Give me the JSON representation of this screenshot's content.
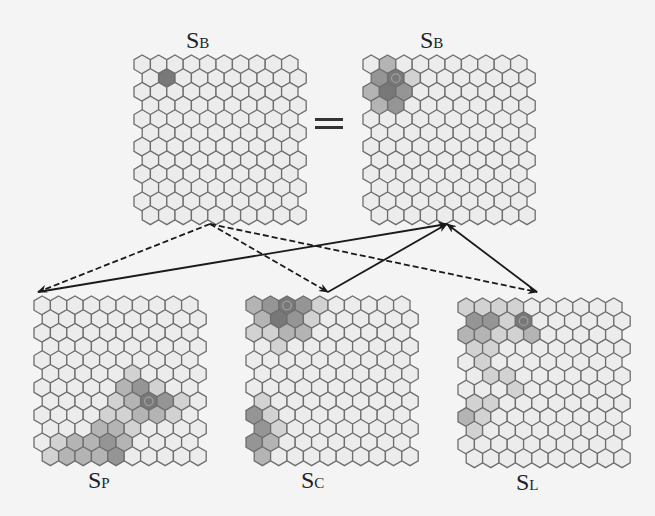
{
  "figure": {
    "equals_sign": "=",
    "grid": {
      "cols": 10,
      "rows": 12,
      "hex_w": 16.4,
      "row_h": 13.7,
      "stroke": "#6e6e6e",
      "base_fill": "#ececec"
    },
    "colors": {
      "level0": "#ececec",
      "level1": "#d2d2d2",
      "level2": "#b4b4b4",
      "level3": "#959595",
      "level4": "#787878",
      "winner_ring": "#a0a0a0",
      "arrow": "#1a1a1a"
    },
    "panels": [
      {
        "id": "SB_left",
        "label_main": "S",
        "label_sub": "B",
        "x": 133,
        "y": 54,
        "label_x": 198,
        "label_y": 28,
        "cells": [
          {
            "r": 1,
            "c": 1,
            "v": 4
          }
        ],
        "winner": null
      },
      {
        "id": "SB_right",
        "label_main": "S",
        "label_sub": "B",
        "x": 362,
        "y": 54,
        "label_x": 432,
        "label_y": 28,
        "cells": [
          {
            "r": 0,
            "c": 1,
            "v": 2
          },
          {
            "r": 1,
            "c": 0,
            "v": 3
          },
          {
            "r": 1,
            "c": 1,
            "v": 4
          },
          {
            "r": 1,
            "c": 2,
            "v": 1
          },
          {
            "r": 2,
            "c": 0,
            "v": 2
          },
          {
            "r": 2,
            "c": 1,
            "v": 4
          },
          {
            "r": 2,
            "c": 2,
            "v": 3
          },
          {
            "r": 3,
            "c": 0,
            "v": 2
          },
          {
            "r": 3,
            "c": 1,
            "v": 3
          }
        ],
        "winner": {
          "r": 1,
          "c": 1
        }
      },
      {
        "id": "SP",
        "label_main": "S",
        "label_sub": "P",
        "x": 33,
        "y": 295,
        "label_x": 100,
        "label_y": 468,
        "cells": [
          {
            "r": 5,
            "c": 5,
            "v": 1
          },
          {
            "r": 6,
            "c": 5,
            "v": 2
          },
          {
            "r": 6,
            "c": 6,
            "v": 3
          },
          {
            "r": 6,
            "c": 7,
            "v": 1
          },
          {
            "r": 7,
            "c": 4,
            "v": 1
          },
          {
            "r": 7,
            "c": 5,
            "v": 2
          },
          {
            "r": 7,
            "c": 6,
            "v": 4
          },
          {
            "r": 7,
            "c": 7,
            "v": 3
          },
          {
            "r": 7,
            "c": 8,
            "v": 1
          },
          {
            "r": 8,
            "c": 4,
            "v": 1
          },
          {
            "r": 8,
            "c": 5,
            "v": 1
          },
          {
            "r": 8,
            "c": 6,
            "v": 2
          },
          {
            "r": 8,
            "c": 7,
            "v": 2
          },
          {
            "r": 8,
            "c": 8,
            "v": 1
          },
          {
            "r": 9,
            "c": 3,
            "v": 2
          },
          {
            "r": 9,
            "c": 4,
            "v": 2
          },
          {
            "r": 9,
            "c": 5,
            "v": 1
          },
          {
            "r": 10,
            "c": 1,
            "v": 1
          },
          {
            "r": 10,
            "c": 2,
            "v": 2
          },
          {
            "r": 10,
            "c": 3,
            "v": 2
          },
          {
            "r": 10,
            "c": 4,
            "v": 3
          },
          {
            "r": 10,
            "c": 5,
            "v": 2
          },
          {
            "r": 11,
            "c": 0,
            "v": 1
          },
          {
            "r": 11,
            "c": 1,
            "v": 2
          },
          {
            "r": 11,
            "c": 2,
            "v": 2
          },
          {
            "r": 11,
            "c": 3,
            "v": 2
          },
          {
            "r": 11,
            "c": 4,
            "v": 3
          }
        ],
        "winner": {
          "r": 7,
          "c": 6
        }
      },
      {
        "id": "SC",
        "label_main": "S",
        "label_sub": "C",
        "x": 245,
        "y": 295,
        "label_x": 313,
        "label_y": 468,
        "cells": [
          {
            "r": 0,
            "c": 0,
            "v": 2
          },
          {
            "r": 0,
            "c": 1,
            "v": 3
          },
          {
            "r": 0,
            "c": 2,
            "v": 4
          },
          {
            "r": 0,
            "c": 3,
            "v": 3
          },
          {
            "r": 0,
            "c": 4,
            "v": 1
          },
          {
            "r": 1,
            "c": 0,
            "v": 2
          },
          {
            "r": 1,
            "c": 1,
            "v": 4
          },
          {
            "r": 1,
            "c": 2,
            "v": 3
          },
          {
            "r": 1,
            "c": 3,
            "v": 1
          },
          {
            "r": 2,
            "c": 0,
            "v": 1
          },
          {
            "r": 2,
            "c": 1,
            "v": 1
          },
          {
            "r": 2,
            "c": 2,
            "v": 2
          },
          {
            "r": 2,
            "c": 3,
            "v": 2
          },
          {
            "r": 3,
            "c": 1,
            "v": 1
          },
          {
            "r": 7,
            "c": 0,
            "v": 1
          },
          {
            "r": 8,
            "c": 0,
            "v": 3
          },
          {
            "r": 8,
            "c": 1,
            "v": 1
          },
          {
            "r": 9,
            "c": 0,
            "v": 3
          },
          {
            "r": 9,
            "c": 1,
            "v": 1
          },
          {
            "r": 10,
            "c": 0,
            "v": 3
          },
          {
            "r": 10,
            "c": 1,
            "v": 2
          },
          {
            "r": 11,
            "c": 0,
            "v": 2
          }
        ],
        "winner": {
          "r": 0,
          "c": 2
        }
      },
      {
        "id": "SL",
        "label_main": "S",
        "label_sub": "L",
        "x": 457,
        "y": 297,
        "label_x": 528,
        "label_y": 470,
        "cells": [
          {
            "r": 0,
            "c": 0,
            "v": 1
          },
          {
            "r": 0,
            "c": 1,
            "v": 1
          },
          {
            "r": 0,
            "c": 2,
            "v": 1
          },
          {
            "r": 0,
            "c": 3,
            "v": 1
          },
          {
            "r": 1,
            "c": 0,
            "v": 3
          },
          {
            "r": 1,
            "c": 1,
            "v": 3
          },
          {
            "r": 1,
            "c": 2,
            "v": 1
          },
          {
            "r": 1,
            "c": 3,
            "v": 4
          },
          {
            "r": 2,
            "c": 0,
            "v": 2
          },
          {
            "r": 2,
            "c": 1,
            "v": 2
          },
          {
            "r": 2,
            "c": 2,
            "v": 1
          },
          {
            "r": 2,
            "c": 3,
            "v": 1
          },
          {
            "r": 2,
            "c": 4,
            "v": 2
          },
          {
            "r": 3,
            "c": 0,
            "v": 1
          },
          {
            "r": 3,
            "c": 1,
            "v": 1
          },
          {
            "r": 4,
            "c": 1,
            "v": 1
          },
          {
            "r": 5,
            "c": 1,
            "v": 1
          },
          {
            "r": 5,
            "c": 2,
            "v": 1
          },
          {
            "r": 6,
            "c": 3,
            "v": 1
          },
          {
            "r": 7,
            "c": 0,
            "v": 1
          },
          {
            "r": 7,
            "c": 1,
            "v": 1
          },
          {
            "r": 8,
            "c": 0,
            "v": 2
          },
          {
            "r": 8,
            "c": 1,
            "v": 1
          },
          {
            "r": 9,
            "c": 0,
            "v": 1
          }
        ],
        "winner": {
          "r": 1,
          "c": 3
        }
      }
    ],
    "arrows": [
      {
        "from": [
          210,
          224
        ],
        "to": [
          38,
          292
        ],
        "style": "dashed"
      },
      {
        "from": [
          210,
          224
        ],
        "to": [
          328,
          292
        ],
        "style": "dashed"
      },
      {
        "from": [
          210,
          224
        ],
        "to": [
          537,
          292
        ],
        "style": "dashed"
      },
      {
        "from": [
          38,
          292
        ],
        "to": [
          447,
          224
        ],
        "style": "solid",
        "arrow_at_start": true
      },
      {
        "from": [
          328,
          292
        ],
        "to": [
          447,
          224
        ],
        "style": "solid"
      },
      {
        "from": [
          537,
          292
        ],
        "to": [
          447,
          224
        ],
        "style": "solid"
      }
    ]
  }
}
